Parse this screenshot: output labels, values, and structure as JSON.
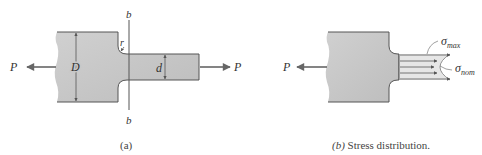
{
  "figure_a": {
    "labels": {
      "force_left": "P",
      "force_right": "P",
      "large_diameter": "D",
      "small_diameter": "d",
      "fillet_radius": "r",
      "section_top": "b",
      "section_bottom": "b"
    },
    "caption": "(a)"
  },
  "figure_b": {
    "labels": {
      "force_left": "P",
      "sigma_max": "σ",
      "sigma_max_sub": "max",
      "sigma_nom": "σ",
      "sigma_nom_sub": "nom"
    },
    "caption_prefix": "(b)",
    "caption_text": " Stress distribution."
  },
  "colors": {
    "bar_fill": "#c8c8c8",
    "outline": "#555555",
    "arrow": "#666666",
    "text": "#333333"
  }
}
